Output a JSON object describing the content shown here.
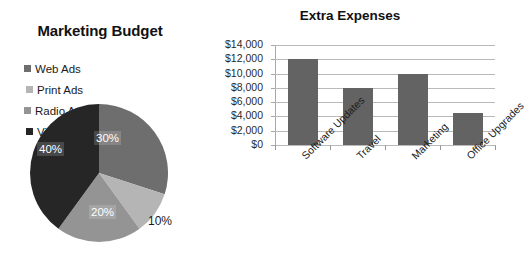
{
  "chart_data": [
    {
      "type": "pie",
      "title": "Marketing Budget",
      "categories": [
        "Web Ads",
        "Print Ads",
        "Radio Ads",
        "Video Ads"
      ],
      "values": [
        30,
        10,
        20,
        40
      ],
      "labels": [
        "30%",
        "10%",
        "20%",
        "40%"
      ],
      "colors": [
        "#6e6e6e",
        "#b5b5b5",
        "#949494",
        "#262626"
      ],
      "legend_position": "top",
      "grid": false
    },
    {
      "type": "bar",
      "title": "Extra Expenses",
      "categories": [
        "Software Updates",
        "Travel",
        "Marketing",
        "Office Upgrades"
      ],
      "values": [
        12000,
        8000,
        10000,
        4500
      ],
      "xlabel": "",
      "ylabel": "",
      "ylim": [
        0,
        14000
      ],
      "ytick_labels": [
        "$14,000",
        "$12,000",
        "$10,000",
        "$8,000",
        "$6,000",
        "$4,000",
        "$2,000",
        "$0"
      ],
      "ytick_values": [
        14000,
        12000,
        10000,
        8000,
        6000,
        4000,
        2000,
        0
      ],
      "bar_color": "#636363",
      "grid": true,
      "xlabel_rotation": "-45"
    }
  ]
}
